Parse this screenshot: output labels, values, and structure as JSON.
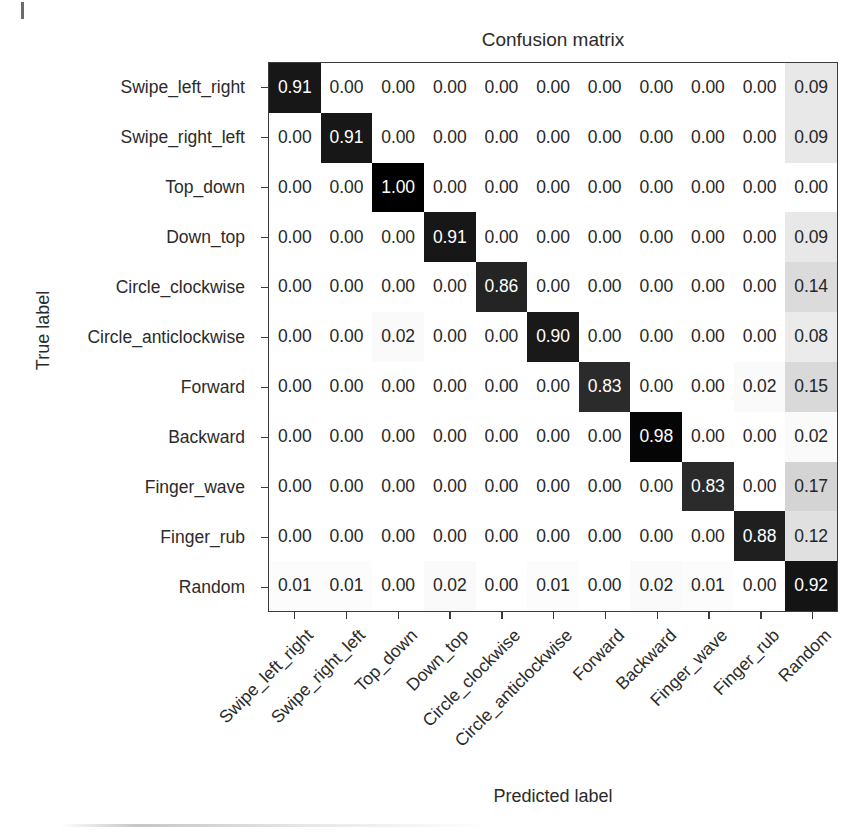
{
  "chart_data": {
    "type": "heatmap",
    "title": "Confusion matrix",
    "xlabel": "Predicted label",
    "ylabel": "True label",
    "colormap": "Greys",
    "normalized": true,
    "value_range": [
      0.0,
      1.0
    ],
    "grid": false,
    "legend": "none",
    "categories": [
      "Swipe_left_right",
      "Swipe_right_left",
      "Top_down",
      "Down_top",
      "Circle_clockwise",
      "Circle_anticlockwise",
      "Forward",
      "Backward",
      "Finger_wave",
      "Finger_rub",
      "Random"
    ],
    "x_tick_labels": [
      "Swipe_left_right",
      "Swipe_right_left",
      "Top_down",
      "Down_top",
      "Circle_clockwise",
      "Circle_anticlockwise",
      "Forward",
      "Backward",
      "Finger_wave",
      "Finger_rub",
      "Random"
    ],
    "y_tick_labels": [
      "Swipe_left_right",
      "Swipe_right_left",
      "Top_down",
      "Down_top",
      "Circle_clockwise",
      "Circle_anticlockwise",
      "Forward",
      "Backward",
      "Finger_wave",
      "Finger_rub",
      "Random"
    ],
    "matrix": [
      [
        0.91,
        0.0,
        0.0,
        0.0,
        0.0,
        0.0,
        0.0,
        0.0,
        0.0,
        0.0,
        0.09
      ],
      [
        0.0,
        0.91,
        0.0,
        0.0,
        0.0,
        0.0,
        0.0,
        0.0,
        0.0,
        0.0,
        0.09
      ],
      [
        0.0,
        0.0,
        1.0,
        0.0,
        0.0,
        0.0,
        0.0,
        0.0,
        0.0,
        0.0,
        0.0
      ],
      [
        0.0,
        0.0,
        0.0,
        0.91,
        0.0,
        0.0,
        0.0,
        0.0,
        0.0,
        0.0,
        0.09
      ],
      [
        0.0,
        0.0,
        0.0,
        0.0,
        0.86,
        0.0,
        0.0,
        0.0,
        0.0,
        0.0,
        0.14
      ],
      [
        0.0,
        0.0,
        0.02,
        0.0,
        0.0,
        0.9,
        0.0,
        0.0,
        0.0,
        0.0,
        0.08
      ],
      [
        0.0,
        0.0,
        0.0,
        0.0,
        0.0,
        0.0,
        0.83,
        0.0,
        0.0,
        0.02,
        0.15
      ],
      [
        0.0,
        0.0,
        0.0,
        0.0,
        0.0,
        0.0,
        0.0,
        0.98,
        0.0,
        0.0,
        0.02
      ],
      [
        0.0,
        0.0,
        0.0,
        0.0,
        0.0,
        0.0,
        0.0,
        0.0,
        0.83,
        0.0,
        0.17
      ],
      [
        0.0,
        0.0,
        0.0,
        0.0,
        0.0,
        0.0,
        0.0,
        0.0,
        0.0,
        0.88,
        0.12
      ],
      [
        0.01,
        0.01,
        0.0,
        0.02,
        0.0,
        0.01,
        0.0,
        0.02,
        0.01,
        0.0,
        0.92
      ]
    ],
    "cell_labels": [
      [
        "0.91",
        "0.00",
        "0.00",
        "0.00",
        "0.00",
        "0.00",
        "0.00",
        "0.00",
        "0.00",
        "0.00",
        "0.09"
      ],
      [
        "0.00",
        "0.91",
        "0.00",
        "0.00",
        "0.00",
        "0.00",
        "0.00",
        "0.00",
        "0.00",
        "0.00",
        "0.09"
      ],
      [
        "0.00",
        "0.00",
        "1.00",
        "0.00",
        "0.00",
        "0.00",
        "0.00",
        "0.00",
        "0.00",
        "0.00",
        "0.00"
      ],
      [
        "0.00",
        "0.00",
        "0.00",
        "0.91",
        "0.00",
        "0.00",
        "0.00",
        "0.00",
        "0.00",
        "0.00",
        "0.09"
      ],
      [
        "0.00",
        "0.00",
        "0.00",
        "0.00",
        "0.86",
        "0.00",
        "0.00",
        "0.00",
        "0.00",
        "0.00",
        "0.14"
      ],
      [
        "0.00",
        "0.00",
        "0.02",
        "0.00",
        "0.00",
        "0.90",
        "0.00",
        "0.00",
        "0.00",
        "0.00",
        "0.08"
      ],
      [
        "0.00",
        "0.00",
        "0.00",
        "0.00",
        "0.00",
        "0.00",
        "0.83",
        "0.00",
        "0.00",
        "0.02",
        "0.15"
      ],
      [
        "0.00",
        "0.00",
        "0.00",
        "0.00",
        "0.00",
        "0.00",
        "0.00",
        "0.98",
        "0.00",
        "0.00",
        "0.02"
      ],
      [
        "0.00",
        "0.00",
        "0.00",
        "0.00",
        "0.00",
        "0.00",
        "0.00",
        "0.00",
        "0.83",
        "0.00",
        "0.17"
      ],
      [
        "0.00",
        "0.00",
        "0.00",
        "0.00",
        "0.00",
        "0.00",
        "0.00",
        "0.00",
        "0.00",
        "0.88",
        "0.12"
      ],
      [
        "0.01",
        "0.01",
        "0.00",
        "0.02",
        "0.00",
        "0.01",
        "0.00",
        "0.02",
        "0.01",
        "0.00",
        "0.92"
      ]
    ],
    "colors": {
      "cell_min": "#ffffff",
      "cell_max": "#000000",
      "text_on_light": "#262626",
      "text_on_dark": "#ffffff",
      "axis_line": "#3c3c3c",
      "background": "#ffffff"
    }
  }
}
